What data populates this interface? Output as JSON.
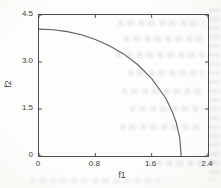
{
  "figure": {
    "kind": "scanned-plot",
    "paper_color": "#fbfbf8",
    "label_color": "#3b3b3b"
  },
  "chart_data": {
    "type": "line",
    "title": "",
    "xlabel": "f1",
    "ylabel": "f2",
    "xlim": [
      0,
      2.4
    ],
    "ylim": [
      0,
      4.5
    ],
    "x_ticks": [
      0,
      0.8,
      1.6,
      2.4
    ],
    "x_tick_labels": [
      "0",
      "0.8",
      "1.6",
      "2.4"
    ],
    "y_ticks": [
      0,
      1.5,
      3.0,
      4.5
    ],
    "y_tick_labels": [
      "0",
      "1.5",
      "3.0",
      "4.5"
    ],
    "grid": false,
    "legend_position": "none",
    "axis_color": "#4d4d4d",
    "curve_color": "#5e5e5e",
    "series": [
      {
        "name": "pareto-front",
        "points": [
          [
            0,
            4.05
          ],
          [
            0.2,
            4.03
          ],
          [
            0.4,
            3.97
          ],
          [
            0.6,
            3.87
          ],
          [
            0.8,
            3.72
          ],
          [
            1.0,
            3.52
          ],
          [
            1.2,
            3.26
          ],
          [
            1.4,
            2.92
          ],
          [
            1.6,
            2.47
          ],
          [
            1.8,
            1.84
          ],
          [
            1.9,
            1.37
          ],
          [
            1.95,
            1.06
          ],
          [
            2.0,
            0.57
          ],
          [
            2.02,
            0
          ]
        ]
      }
    ]
  }
}
